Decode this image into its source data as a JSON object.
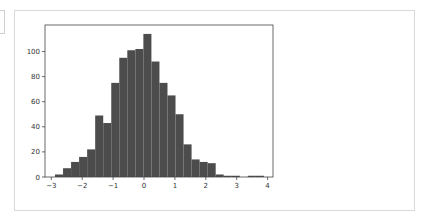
{
  "chart_data": {
    "type": "bar",
    "subtype": "histogram",
    "title": "",
    "xlabel": "",
    "ylabel": "",
    "bin_edges": [
      -2.88,
      -2.62,
      -2.36,
      -2.1,
      -1.84,
      -1.58,
      -1.32,
      -1.06,
      -0.8,
      -0.54,
      -0.28,
      -0.02,
      0.24,
      0.5,
      0.76,
      1.02,
      1.28,
      1.54,
      1.8,
      2.06,
      2.32,
      2.58,
      2.84,
      3.1,
      3.36,
      3.62,
      3.88
    ],
    "values": [
      2,
      7,
      12,
      16,
      22,
      49,
      43,
      75,
      95,
      101,
      102,
      114,
      92,
      75,
      65,
      50,
      26,
      14,
      12,
      11,
      2,
      1,
      1,
      0,
      1,
      1
    ],
    "xlim": [
      -3.2,
      4.2
    ],
    "ylim": [
      0,
      120
    ],
    "xticks": [
      -3,
      -2,
      -1,
      0,
      1,
      2,
      3,
      4
    ],
    "yticks": [
      0,
      20,
      40,
      60,
      80,
      100
    ],
    "bar_color": "#4c4c4c",
    "grid": false,
    "legend": null
  }
}
